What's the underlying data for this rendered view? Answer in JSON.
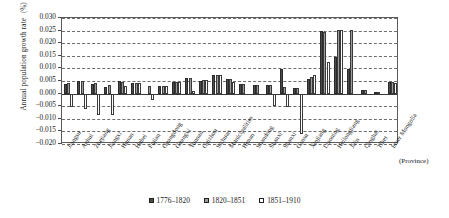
{
  "chart_data": {
    "type": "bar",
    "title": "",
    "xlabel": "(Province)",
    "ylabel": "Annual population growth rate (%)",
    "ylim": [
      -0.02,
      0.03
    ],
    "ytick_labels": [
      "0.030",
      "0.025",
      "0.020",
      "0.015",
      "0.010",
      "0.005",
      "0.000",
      "−0.005",
      "−0.010",
      "−0.015",
      "−0.020"
    ],
    "ytick_values": [
      0.03,
      0.025,
      0.02,
      0.015,
      0.01,
      0.005,
      0.0,
      -0.005,
      -0.01,
      -0.015,
      -0.02
    ],
    "grid": true,
    "legend_position": "bottom",
    "categories": [
      "Jiangsu",
      "Anhui",
      "Zhejiang",
      "Jiangxi",
      "Hunan",
      "Hubei",
      "Fujian",
      "Guangdong",
      "Guangxi",
      "Yunnan",
      "Guizhou",
      "Sichuan",
      "Municipalities",
      "Henan",
      "Shandong",
      "Shanxi",
      "Shanxi",
      "Gansu",
      "Xinjiang",
      "Liaoning",
      "Heilongjiang",
      "Jilin",
      "Qinghai",
      "Tibet",
      "Inner Mongolia"
    ],
    "series": [
      {
        "name": "1776–1820",
        "color": "#4a4a4a",
        "values": [
          0.004,
          0.005,
          0.0038,
          0.0028,
          0.005,
          0.0043,
          0.0,
          0.003,
          0.0046,
          0.006,
          0.005,
          0.0074,
          0.0057,
          0.0038,
          0.0033,
          0.0034,
          0.0098,
          0.0023,
          0.0058,
          0.025,
          0.0147,
          0.0098,
          0.0014,
          0.0008,
          0.0048
        ]
      },
      {
        "name": "1820–1851",
        "color": "#9b9b9b",
        "values": [
          0.0042,
          0.005,
          0.0044,
          0.0033,
          0.0048,
          0.0043,
          0.0032,
          0.0031,
          0.0047,
          0.0063,
          0.0052,
          0.0075,
          0.0057,
          0.0037,
          0.0033,
          0.0034,
          0.0026,
          0.0023,
          0.0065,
          0.0245,
          0.0252,
          0.0253,
          0.0014,
          0.0008,
          0.0047
        ]
      },
      {
        "name": "1851–1910",
        "color": "#ffffff",
        "values": [
          -0.0053,
          -0.0062,
          -0.0085,
          -0.0086,
          0.003,
          0.0042,
          -0.0025,
          0.0031,
          0.0047,
          0.001,
          0.0052,
          0.0073,
          0.0048,
          0.0,
          0.0,
          -0.0048,
          -0.0054,
          -0.0162,
          0.0075,
          0.0124,
          0.0252,
          0.0,
          0.0,
          0.0,
          0.0043
        ]
      }
    ]
  },
  "legend": {
    "items": [
      {
        "label": "1776–1820"
      },
      {
        "label": "1820–1851"
      },
      {
        "label": "1851–1910"
      }
    ]
  },
  "axis": {
    "y_title": "Annual population growth rate（%）",
    "x_note": "(Province)"
  }
}
